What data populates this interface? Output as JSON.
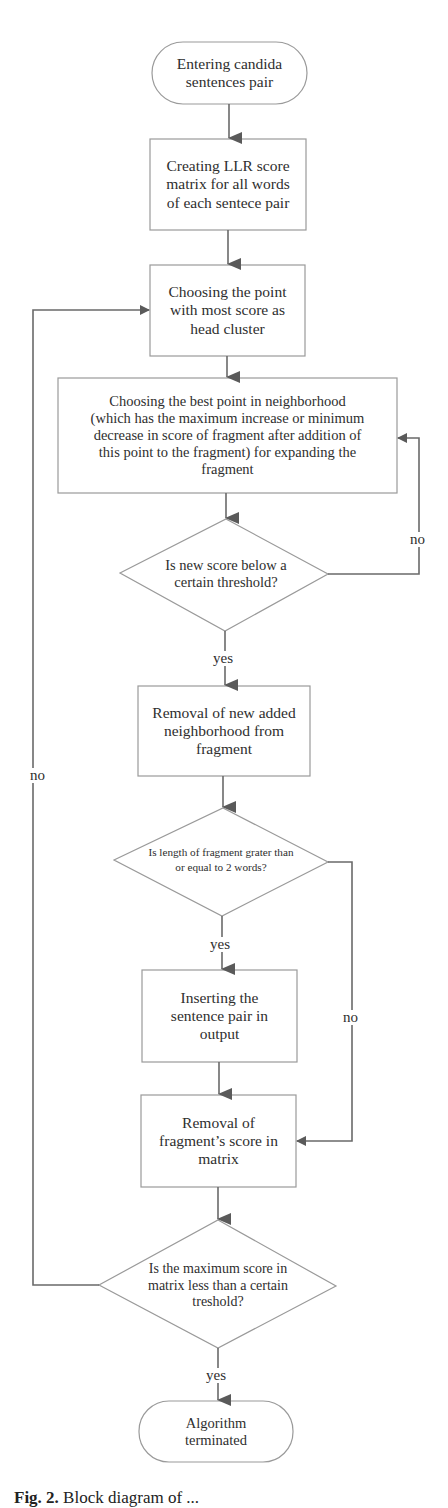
{
  "diagram": {
    "type": "flowchart",
    "nodes": {
      "start": {
        "shape": "terminal",
        "lines": [
          "Entering candida",
          "sentences pair"
        ]
      },
      "create_matrix": {
        "shape": "process",
        "lines": [
          "Creating LLR score",
          "matrix for all words",
          "of each sentece pair"
        ]
      },
      "choose_head": {
        "shape": "process",
        "lines": [
          "Choosing the point",
          "with most score as",
          "head cluster"
        ]
      },
      "choose_best": {
        "shape": "process",
        "lines": [
          "Choosing the best point in neighborhood",
          "(which has the maximum increase or minimum",
          "decrease in score of fragment after addition of",
          "this point to the fragment)  for expanding the",
          "fragment"
        ]
      },
      "decision_threshold": {
        "shape": "decision",
        "lines": [
          "Is new score below a",
          "certain threshold?"
        ]
      },
      "remove_neighborhood": {
        "shape": "process",
        "lines": [
          "Removal of new added",
          "neighborhood from",
          "fragment"
        ]
      },
      "decision_length": {
        "shape": "decision",
        "lines": [
          "Is length of fragment grater than",
          "or equal to  2 words?"
        ]
      },
      "insert_output": {
        "shape": "process",
        "lines": [
          "Inserting the",
          "sentence pair in",
          "output"
        ]
      },
      "remove_score": {
        "shape": "process",
        "lines": [
          "Removal of",
          "fragment’s score in",
          "matrix"
        ]
      },
      "decision_max": {
        "shape": "decision",
        "lines": [
          "Is the maximum score in",
          "matrix less than a certain",
          "treshold?"
        ]
      },
      "end": {
        "shape": "terminal",
        "lines": [
          "Algorithm",
          "terminated"
        ]
      }
    },
    "edge_labels": {
      "threshold_no": "no",
      "threshold_yes": "yes",
      "length_yes": "yes",
      "length_no": "no",
      "max_no": "no",
      "max_yes": "yes"
    },
    "edges": [
      {
        "from": "start",
        "to": "create_matrix"
      },
      {
        "from": "create_matrix",
        "to": "choose_head"
      },
      {
        "from": "choose_head",
        "to": "choose_best"
      },
      {
        "from": "choose_best",
        "to": "decision_threshold"
      },
      {
        "from": "decision_threshold",
        "to": "choose_best",
        "label": "no"
      },
      {
        "from": "decision_threshold",
        "to": "remove_neighborhood",
        "label": "yes"
      },
      {
        "from": "remove_neighborhood",
        "to": "decision_length"
      },
      {
        "from": "decision_length",
        "to": "insert_output",
        "label": "yes"
      },
      {
        "from": "decision_length",
        "to": "remove_score",
        "label": "no"
      },
      {
        "from": "insert_output",
        "to": "remove_score"
      },
      {
        "from": "remove_score",
        "to": "decision_max"
      },
      {
        "from": "decision_max",
        "to": "choose_head",
        "label": "no"
      },
      {
        "from": "decision_max",
        "to": "end",
        "label": "yes"
      }
    ],
    "colors": {
      "stroke": "#9a9a9a",
      "arrow": "#5a5a5a",
      "text": "#2e2e2e",
      "background": "#ffffff"
    }
  },
  "caption": {
    "prefix": "Fig. 2.",
    "text": "Block diagram of ..."
  }
}
